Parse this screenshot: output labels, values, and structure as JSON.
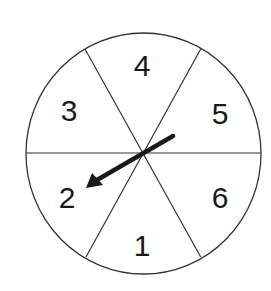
{
  "spinner": {
    "sections": [
      {
        "label": "1",
        "position": "bottom"
      },
      {
        "label": "2",
        "position": "lower-left"
      },
      {
        "label": "3",
        "position": "upper-left"
      },
      {
        "label": "4",
        "position": "top"
      },
      {
        "label": "5",
        "position": "upper-right"
      },
      {
        "label": "6",
        "position": "lower-right"
      }
    ],
    "arrow_points_to": "2",
    "colors": {
      "line": "#333333",
      "arrow": "#1a1a1a",
      "background": "#ffffff"
    }
  }
}
